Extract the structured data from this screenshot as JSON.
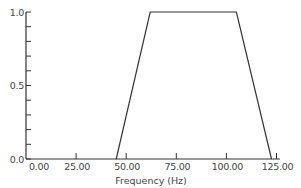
{
  "chart_data": {
    "type": "line",
    "title": "",
    "xlabel": "Frequency (Hz)",
    "ylabel": "",
    "xlim": [
      0,
      128
    ],
    "ylim": [
      0,
      1.0
    ],
    "grid": false,
    "legend": null,
    "x_ticks": [
      0,
      25,
      50,
      75,
      100,
      125
    ],
    "x_tick_labels": [
      "0.00",
      "25.00",
      "50.00",
      "75.00",
      "100.00",
      "125.00"
    ],
    "y_ticks": [
      0,
      0.1,
      0.2,
      0.3,
      0.4,
      0.5,
      0.6,
      0.7,
      0.8,
      0.9,
      1.0
    ],
    "y_tick_labels": [
      "0.0",
      "",
      "",
      "",
      "",
      "0.5",
      "",
      "",
      "",
      "",
      "1.0"
    ],
    "series": [
      {
        "name": "response",
        "x": [
          45,
          62,
          105,
          122.5
        ],
        "y": [
          0,
          1.0,
          1.0,
          0
        ]
      }
    ]
  }
}
